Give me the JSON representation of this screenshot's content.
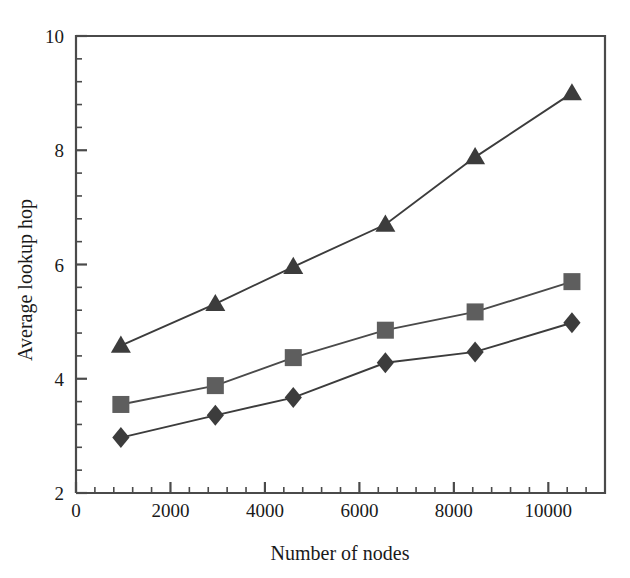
{
  "chart_data": {
    "type": "line",
    "title": "",
    "xlabel": "Number of nodes",
    "ylabel": "Average lookup hop",
    "xlim": [
      0,
      11200
    ],
    "ylim": [
      2,
      10
    ],
    "xticks": [
      0,
      2000,
      4000,
      6000,
      8000,
      10000
    ],
    "xtick_labels": [
      "0",
      "2000",
      "4000",
      "6000",
      "8000",
      "10000"
    ],
    "yticks": [
      2,
      4,
      6,
      8,
      10
    ],
    "ytick_labels": [
      "2",
      "4",
      "6",
      "8",
      "10"
    ],
    "x_minor_tick_interval": 400,
    "y_minor_tick_interval": 0.4,
    "grid": false,
    "legend": "none",
    "x": [
      950,
      2950,
      4600,
      6550,
      8450,
      10500
    ],
    "series": [
      {
        "name": "triangle-series",
        "marker": "triangle",
        "color": "#3c3c3c",
        "line_color": "#3c3c3c",
        "values": [
          4.58,
          5.31,
          5.96,
          6.7,
          7.88,
          9.0
        ]
      },
      {
        "name": "square-series",
        "marker": "square",
        "color": "#5e5e5e",
        "line_color": "#4a4a4a",
        "values": [
          3.55,
          3.88,
          4.37,
          4.85,
          5.17,
          5.7
        ]
      },
      {
        "name": "diamond-series",
        "marker": "diamond",
        "color": "#3c3c3c",
        "line_color": "#3c3c3c",
        "values": [
          2.97,
          3.36,
          3.67,
          4.28,
          4.47,
          4.98
        ]
      }
    ],
    "axis_color": "#4a4a4a"
  }
}
